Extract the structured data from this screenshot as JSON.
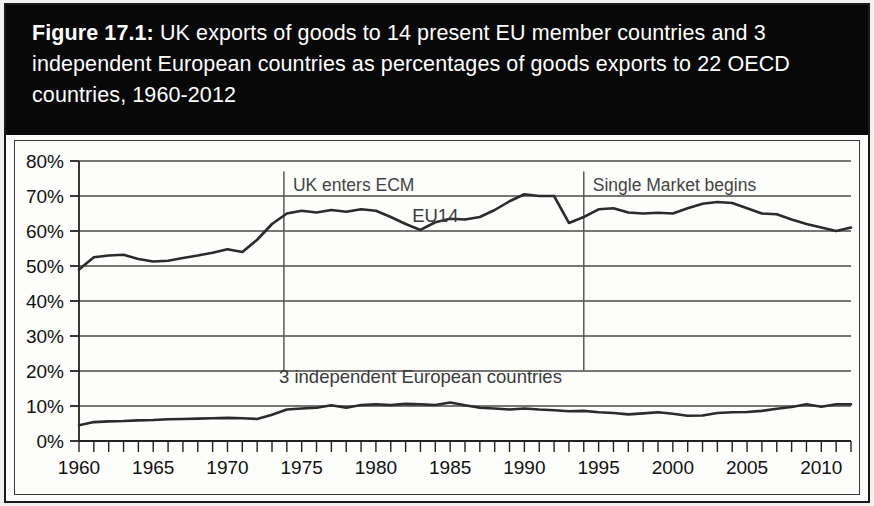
{
  "figure": {
    "number_label": "Figure 17.1:",
    "title_rest": " UK exports of goods to 14 present EU member countries and 3 independent European countries as percentages of goods exports to 22 OECD countries, 1960-2012",
    "title_full": "Figure 17.1: UK exports of goods to 14 present EU member countries and 3 independent European countries as percentages of goods exports to 22 OECD countries, 1960-2012",
    "band_color": "#080808",
    "band_text_color": "#ffffff",
    "panel_background": "#fdfdfb"
  },
  "chart_data": {
    "type": "line",
    "title": "UK exports of goods to 14 present EU member countries and 3 independent European countries as percentages of goods exports to 22 OECD countries, 1960-2012",
    "xlabel": "",
    "ylabel": "",
    "xlim": [
      1960,
      2012
    ],
    "ylim": [
      0,
      80
    ],
    "ytick_step": 10,
    "ytick_labels": [
      "0%",
      "10%",
      "20%",
      "30%",
      "40%",
      "50%",
      "60%",
      "70%",
      "80%"
    ],
    "ytick_values": [
      0,
      10,
      20,
      30,
      40,
      50,
      60,
      70,
      80
    ],
    "xtick_labels": [
      "1960",
      "1965",
      "1970",
      "1975",
      "1980",
      "1985",
      "1990",
      "1995",
      "2000",
      "2005",
      "2010"
    ],
    "xtick_values": [
      1960,
      1965,
      1970,
      1975,
      1980,
      1985,
      1990,
      1995,
      2000,
      2005,
      2010
    ],
    "xtick_minor_step": 1,
    "grid": "horizontal",
    "legend": "inline-labels",
    "line_color": "#2b2b2b",
    "grid_color": "#4a4a4a",
    "x": [
      1960,
      1961,
      1962,
      1963,
      1964,
      1965,
      1966,
      1967,
      1968,
      1969,
      1970,
      1971,
      1972,
      1973,
      1974,
      1975,
      1976,
      1977,
      1978,
      1979,
      1980,
      1981,
      1982,
      1983,
      1984,
      1985,
      1986,
      1987,
      1988,
      1989,
      1990,
      1991,
      1992,
      1993,
      1994,
      1995,
      1996,
      1997,
      1998,
      1999,
      2000,
      2001,
      2002,
      2003,
      2004,
      2005,
      2006,
      2007,
      2008,
      2009,
      2010,
      2011,
      2012
    ],
    "series": [
      {
        "name": "EU14",
        "label": "EU14",
        "values": [
          49.0,
          52.5,
          53.0,
          53.2,
          52.0,
          51.3,
          51.5,
          52.3,
          53.0,
          53.8,
          54.8,
          54.0,
          57.5,
          62.0,
          65.0,
          65.8,
          65.3,
          66.0,
          65.5,
          66.2,
          65.8,
          64.0,
          62.0,
          60.3,
          62.5,
          63.5,
          63.3,
          64.0,
          66.0,
          68.5,
          70.5,
          70.0,
          70.0,
          62.3,
          64.0,
          66.2,
          66.5,
          65.3,
          65.0,
          65.2,
          65.0,
          66.5,
          67.8,
          68.3,
          68.0,
          66.5,
          65.0,
          64.8,
          63.3,
          62.0,
          61.0,
          60.0,
          61.0
        ]
      },
      {
        "name": "3 independent European countries",
        "label": "3 independent European countries",
        "values": [
          4.5,
          5.4,
          5.6,
          5.7,
          5.9,
          6.0,
          6.2,
          6.3,
          6.4,
          6.5,
          6.6,
          6.5,
          6.3,
          7.5,
          9.0,
          9.3,
          9.5,
          10.2,
          9.5,
          10.3,
          10.5,
          10.3,
          10.6,
          10.5,
          10.3,
          11.0,
          10.2,
          9.5,
          9.3,
          9.0,
          9.3,
          9.0,
          8.8,
          8.5,
          8.6,
          8.2,
          8.0,
          7.6,
          7.9,
          8.2,
          7.8,
          7.2,
          7.3,
          8.0,
          8.2,
          8.3,
          8.6,
          9.2,
          9.7,
          10.5,
          9.8,
          10.5,
          10.5
        ]
      }
    ],
    "annotations": [
      {
        "text": "UK enters ECM",
        "x": 1973.8,
        "y_top": 77.0,
        "y_bottom": 20.0,
        "label_anchor": "start"
      },
      {
        "text": "Single Market begins",
        "x": 1994.0,
        "y_top": 77.0,
        "y_bottom": 20.0,
        "label_anchor": "start"
      }
    ],
    "series_labels": [
      {
        "text": "EU14",
        "x": 1984.0,
        "y": 62.5
      },
      {
        "text": "3 independent European countries",
        "x": 1983.0,
        "y": 16.5
      }
    ]
  }
}
